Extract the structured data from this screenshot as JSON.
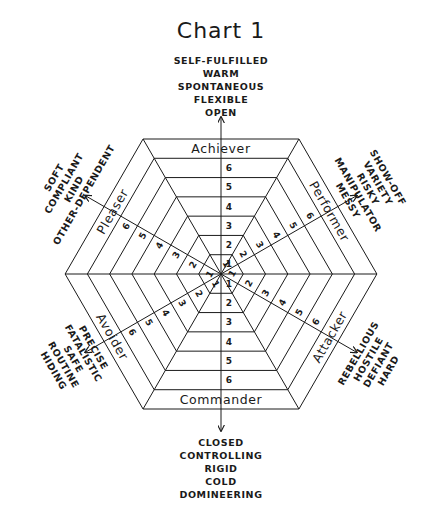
{
  "title": "Chart 1",
  "center": [
    221,
    274
  ],
  "outer_half_height": 135,
  "ring_count": 7,
  "band_numbers": [
    "1",
    "2",
    "3",
    "4",
    "5",
    "6"
  ],
  "segments": [
    {
      "name": "achiever",
      "label": "Achiever",
      "angle": -90
    },
    {
      "name": "performer",
      "label": "Performer",
      "angle": -30
    },
    {
      "name": "attacker",
      "label": "Attacker",
      "angle": 30
    },
    {
      "name": "commander",
      "label": "Commander",
      "angle": 90
    },
    {
      "name": "avoider",
      "label": "Avoider",
      "angle": 150
    },
    {
      "name": "pleaser",
      "label": "Pleaser",
      "angle": 210
    }
  ],
  "trait_groups": [
    {
      "name": "top",
      "angle": -90,
      "traits": [
        "SELF-FULFILLED",
        "WARM",
        "SPONTANEOUS",
        "FLEXIBLE",
        "OPEN"
      ]
    },
    {
      "name": "upper-right",
      "angle": -30,
      "traits": [
        "MESSY",
        "MANIPULATOR",
        "RISKY",
        "VARIETY",
        "SHOW-OFF"
      ]
    },
    {
      "name": "lower-right",
      "angle": 30,
      "traits": [
        "HARD",
        "DEFIANT",
        "HOSTILE",
        "REBELLIOUS"
      ]
    },
    {
      "name": "bottom",
      "angle": 90,
      "traits": [
        "CLOSED",
        "CONTROLLING",
        "RIGID",
        "COLD",
        "DOMINEERING"
      ]
    },
    {
      "name": "lower-left",
      "angle": 150,
      "traits": [
        "HIDING",
        "ROUTINE",
        "SAFE",
        "FATALISTIC",
        "PRECISE"
      ]
    },
    {
      "name": "upper-left",
      "angle": 210,
      "traits": [
        "OTHER-DEPENDENT",
        "KIND",
        "COMPLIANT",
        "SOFT"
      ]
    }
  ],
  "colors": {
    "ink": "#1a1a1a",
    "paper": "#ffffff"
  }
}
